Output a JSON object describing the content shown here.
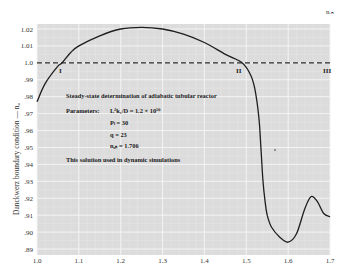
{
  "chart_data": {
    "type": "line",
    "title": "Steady-state determination of adiabatic tubular reactor",
    "xlabel": "",
    "ylabel": "Danckwerz boundary condition — n₀",
    "top_right_label": "n_in",
    "xlim": [
      1.0,
      1.7
    ],
    "ylim": [
      0.89,
      1.02
    ],
    "grid": true,
    "x_ticks": [
      "1.0",
      "1.1",
      "1.2",
      "1.3",
      "1.4",
      "1.5",
      "1.6",
      "1.7"
    ],
    "y_ticks": [
      "1.02",
      "1.01",
      "1.0",
      ".99",
      ".98",
      ".97",
      ".96",
      ".95",
      ".94",
      ".93",
      ".92",
      ".91",
      ".90",
      ".89"
    ],
    "series": [
      {
        "name": "boundary condition",
        "style": "solid",
        "x": [
          1.0,
          1.02,
          1.05,
          1.06,
          1.08,
          1.1,
          1.15,
          1.2,
          1.25,
          1.3,
          1.35,
          1.4,
          1.45,
          1.49,
          1.51,
          1.52,
          1.53,
          1.535,
          1.54,
          1.545,
          1.55,
          1.56,
          1.58,
          1.6,
          1.62,
          1.64,
          1.655,
          1.67,
          1.685,
          1.7
        ],
        "y": [
          0.977,
          0.988,
          0.998,
          1.0,
          1.006,
          1.01,
          1.016,
          1.02,
          1.021,
          1.02,
          1.017,
          1.012,
          1.005,
          1.0,
          0.993,
          0.985,
          0.968,
          0.95,
          0.93,
          0.918,
          0.91,
          0.903,
          0.897,
          0.894,
          0.899,
          0.914,
          0.921,
          0.918,
          0.911,
          0.909
        ]
      },
      {
        "name": "n = 1.0 reference",
        "style": "dashed",
        "x": [
          1.0,
          1.7
        ],
        "y": [
          1.0,
          1.0
        ]
      }
    ],
    "annotations": [
      {
        "text": "I",
        "x": 1.06,
        "y": 1.0
      },
      {
        "text": "II",
        "x": 1.49,
        "y": 1.0
      },
      {
        "text": "III",
        "x": 1.7,
        "y": 1.0
      },
      {
        "text": "Steady-state determination of adiabatic tubular reactor"
      },
      {
        "text": "Parameters:  L²k₁/D = 1.2 × 10¹⁰"
      },
      {
        "text": "Pₗ = 30"
      },
      {
        "text": "q = 23"
      },
      {
        "text": "n₀ₙ = 1.706"
      },
      {
        "text": "This solution used in dynamic simulations"
      }
    ]
  },
  "labels": {
    "title": "Steady-state determination of adiabatic tubular reactor",
    "params_label": "Parameters:",
    "param1": "L²k₁/D = 1.2 × 10¹⁰",
    "param2": "Pₗ = 30",
    "param3": "q = 23",
    "param4": "n₀ₙ = 1.706",
    "note": "This solution used in dynamic simulations",
    "roman1": "I",
    "roman2": "II",
    "roman3": "III",
    "ylabel": "Danckwerz boundary condition — n₀",
    "top_right": "nᵢₙ"
  },
  "colors": {
    "plot_bg": "#dcdcdc",
    "grid": "#f2f2f2",
    "curve": "#1e1e1e"
  }
}
